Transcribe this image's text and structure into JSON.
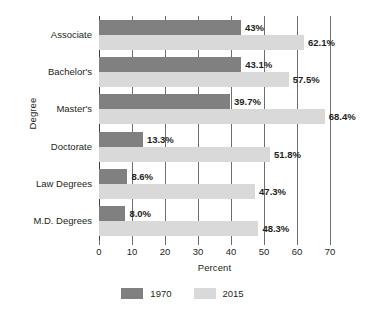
{
  "chart_data": {
    "type": "bar",
    "orientation": "horizontal",
    "title": "",
    "xlabel": "Percent",
    "ylabel": "Degree",
    "xlim": [
      0,
      70
    ],
    "xticks": [
      0,
      10,
      20,
      30,
      40,
      50,
      60,
      70
    ],
    "grid": true,
    "grid_axis": "x",
    "legend_position": "bottom",
    "categories": [
      "Associate",
      "Bachelor's",
      "Master's",
      "Doctorate",
      "Law Degrees",
      "M.D. Degrees"
    ],
    "series": [
      {
        "name": "1970",
        "color": "#808080",
        "values": [
          43.0,
          43.1,
          39.7,
          13.3,
          8.6,
          8.0
        ],
        "labels": [
          "43%",
          "43.1%",
          "39.7%",
          "13.3%",
          "8.6%",
          "8.0%"
        ]
      },
      {
        "name": "2015",
        "color": "#d9d9d9",
        "values": [
          62.1,
          57.5,
          68.4,
          51.8,
          47.3,
          48.3
        ],
        "labels": [
          "62.1%",
          "57.5%",
          "68.4%",
          "51.8%",
          "47.3%",
          "48.3%"
        ]
      }
    ]
  },
  "axis": {
    "x_tick_labels": [
      "0",
      "10",
      "20",
      "30",
      "40",
      "50",
      "60",
      "70"
    ],
    "x_title": "Percent",
    "y_title": "Degree"
  },
  "legend": {
    "items": [
      {
        "label": "1970",
        "color": "#808080"
      },
      {
        "label": "2015",
        "color": "#d9d9d9"
      }
    ]
  }
}
